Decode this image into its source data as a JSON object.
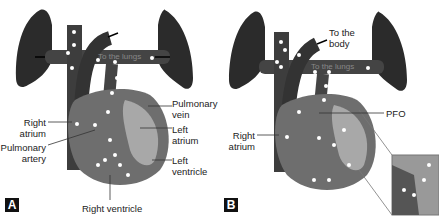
{
  "panels": [
    {
      "id": "A",
      "badge": "A",
      "vessel_labels": {
        "aorta": "Aorta",
        "lungs": "To the lungs"
      },
      "labels": {
        "pulmonary_vein": "Pulmonary\nvein",
        "left_atrium": "Left\natrium",
        "left_ventricle": "Left\nventricle",
        "right_atrium": "Right\natrium",
        "pulmonary_artery": "Pulmonary\nartery",
        "right_ventricle": "Right ventricle"
      }
    },
    {
      "id": "B",
      "badge": "B",
      "vessel_labels": {
        "lungs": "To the lungs"
      },
      "labels": {
        "to_body": "To the\nbody",
        "pfo": "PFO",
        "right_atrium": "Right\natrium"
      }
    }
  ],
  "colors": {
    "lung": "#2b2b2b",
    "vessel": "#3a3a3a",
    "heart": "#6e6e6e",
    "left_heart": "#a8a8a8",
    "bubble": "#ffffff"
  }
}
